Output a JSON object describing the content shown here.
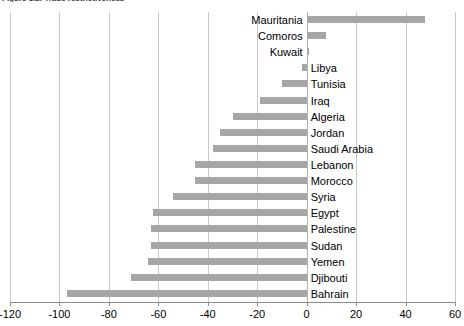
{
  "chart_data": {
    "type": "bar",
    "orientation": "horizontal",
    "title": "Figure 3.2. Trade restrictiveness",
    "xlabel": "",
    "ylabel": "",
    "xlim": [
      -120,
      60
    ],
    "xticks": [
      -120,
      -100,
      -80,
      -60,
      -40,
      -20,
      0,
      20,
      40,
      60
    ],
    "xtick_labels": [
      "-120",
      "-100",
      "-80",
      "-60",
      "-40",
      "-20",
      "0",
      "20",
      "40",
      "60"
    ],
    "grid": true,
    "legend": false,
    "bar_color": "#a6a6a6",
    "categories": [
      "Mauritania",
      "Comoros",
      "Kuwait",
      "Libya",
      "Tunisia",
      "Iraq",
      "Algeria",
      "Jordan",
      "Saudi Arabia",
      "Lebanon",
      "Morocco",
      "Syria",
      "Egypt",
      "Palestine",
      "Sudan",
      "Yemen",
      "Djibouti",
      "Bahrain"
    ],
    "values": [
      48,
      8,
      1,
      -2,
      -10,
      -19,
      -30,
      -35,
      -38,
      -45,
      -45,
      -54,
      -62,
      -63,
      -63,
      -64,
      -71,
      -97
    ],
    "label_side": [
      "right",
      "right",
      "right",
      "left",
      "left",
      "left",
      "left",
      "left",
      "left",
      "left",
      "left",
      "left",
      "left",
      "left",
      "left",
      "left",
      "left",
      "left"
    ]
  }
}
